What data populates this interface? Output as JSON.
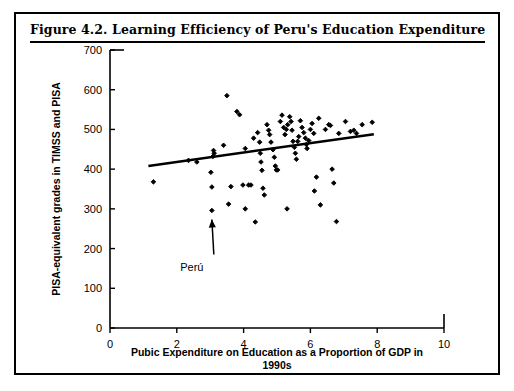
{
  "figure": {
    "title": "Figure 4.2.  Learning Efficiency of Peru's Education Expenditure"
  },
  "chart_data": {
    "type": "scatter",
    "title": "Learning Efficiency of Peru's Education Expenditure",
    "xlabel": "Pubic Expenditure on Education as a Proportion of GDP in 1990s",
    "xlabel_line1": "Pubic Expenditure on Education as a Proportion of GDP in",
    "xlabel_line2": "1990s",
    "ylabel": "PISA-equivalent grades in TIMSS and PISA",
    "xlim": [
      0,
      10
    ],
    "ylim": [
      0,
      700
    ],
    "xticks": [
      0,
      2,
      4,
      6,
      8,
      10
    ],
    "yticks": [
      0,
      100,
      200,
      300,
      400,
      500,
      600,
      700
    ],
    "grid": false,
    "legend": false,
    "marker_color": "#000000",
    "marker_shape": "diamond",
    "trendline": {
      "label": "linear fit",
      "color": "#000000",
      "x_start": 1.15,
      "y_start": 408,
      "x_end": 7.9,
      "y_end": 488
    },
    "annotations": [
      {
        "text": "Perú",
        "point_x": 3.05,
        "point_y": 296,
        "label_x": 2.45,
        "label_y": 185
      }
    ],
    "points": [
      {
        "x": 1.3,
        "y": 368
      },
      {
        "x": 2.35,
        "y": 422
      },
      {
        "x": 2.6,
        "y": 418
      },
      {
        "x": 3.05,
        "y": 296
      },
      {
        "x": 3.05,
        "y": 355
      },
      {
        "x": 3.02,
        "y": 392
      },
      {
        "x": 3.08,
        "y": 432
      },
      {
        "x": 3.12,
        "y": 440
      },
      {
        "x": 3.1,
        "y": 447
      },
      {
        "x": 3.5,
        "y": 585
      },
      {
        "x": 3.8,
        "y": 545
      },
      {
        "x": 3.88,
        "y": 537
      },
      {
        "x": 3.4,
        "y": 460
      },
      {
        "x": 3.62,
        "y": 356
      },
      {
        "x": 3.55,
        "y": 312
      },
      {
        "x": 3.98,
        "y": 360
      },
      {
        "x": 4.05,
        "y": 452
      },
      {
        "x": 4.15,
        "y": 360
      },
      {
        "x": 4.22,
        "y": 360
      },
      {
        "x": 4.35,
        "y": 267
      },
      {
        "x": 4.3,
        "y": 478
      },
      {
        "x": 4.42,
        "y": 492
      },
      {
        "x": 4.48,
        "y": 468
      },
      {
        "x": 4.5,
        "y": 440
      },
      {
        "x": 4.52,
        "y": 418
      },
      {
        "x": 4.55,
        "y": 397
      },
      {
        "x": 4.58,
        "y": 352
      },
      {
        "x": 4.62,
        "y": 335
      },
      {
        "x": 4.7,
        "y": 512
      },
      {
        "x": 4.75,
        "y": 498
      },
      {
        "x": 4.78,
        "y": 487
      },
      {
        "x": 4.82,
        "y": 468
      },
      {
        "x": 4.88,
        "y": 449
      },
      {
        "x": 4.92,
        "y": 430
      },
      {
        "x": 4.95,
        "y": 408
      },
      {
        "x": 4.98,
        "y": 398
      },
      {
        "x": 5.02,
        "y": 398
      },
      {
        "x": 5.1,
        "y": 520
      },
      {
        "x": 5.15,
        "y": 536
      },
      {
        "x": 5.2,
        "y": 505
      },
      {
        "x": 5.24,
        "y": 487
      },
      {
        "x": 5.28,
        "y": 500
      },
      {
        "x": 5.32,
        "y": 512
      },
      {
        "x": 5.38,
        "y": 532
      },
      {
        "x": 5.42,
        "y": 520
      },
      {
        "x": 5.45,
        "y": 498
      },
      {
        "x": 5.48,
        "y": 470
      },
      {
        "x": 5.52,
        "y": 455
      },
      {
        "x": 5.55,
        "y": 440
      },
      {
        "x": 5.58,
        "y": 425
      },
      {
        "x": 5.62,
        "y": 470
      },
      {
        "x": 5.65,
        "y": 482
      },
      {
        "x": 5.7,
        "y": 522
      },
      {
        "x": 5.75,
        "y": 505
      },
      {
        "x": 5.8,
        "y": 492
      },
      {
        "x": 5.85,
        "y": 478
      },
      {
        "x": 5.88,
        "y": 462
      },
      {
        "x": 5.9,
        "y": 452
      },
      {
        "x": 5.95,
        "y": 472
      },
      {
        "x": 6.0,
        "y": 500
      },
      {
        "x": 6.05,
        "y": 515
      },
      {
        "x": 6.1,
        "y": 490
      },
      {
        "x": 6.12,
        "y": 345
      },
      {
        "x": 6.18,
        "y": 380
      },
      {
        "x": 6.25,
        "y": 528
      },
      {
        "x": 6.3,
        "y": 310
      },
      {
        "x": 6.45,
        "y": 500
      },
      {
        "x": 6.55,
        "y": 512
      },
      {
        "x": 6.6,
        "y": 510
      },
      {
        "x": 6.65,
        "y": 400
      },
      {
        "x": 6.7,
        "y": 365
      },
      {
        "x": 6.78,
        "y": 268
      },
      {
        "x": 6.85,
        "y": 490
      },
      {
        "x": 7.05,
        "y": 520
      },
      {
        "x": 7.2,
        "y": 495
      },
      {
        "x": 7.3,
        "y": 498
      },
      {
        "x": 7.38,
        "y": 490
      },
      {
        "x": 7.55,
        "y": 512
      },
      {
        "x": 7.85,
        "y": 518
      },
      {
        "x": 5.3,
        "y": 300
      },
      {
        "x": 4.05,
        "y": 300
      }
    ]
  }
}
